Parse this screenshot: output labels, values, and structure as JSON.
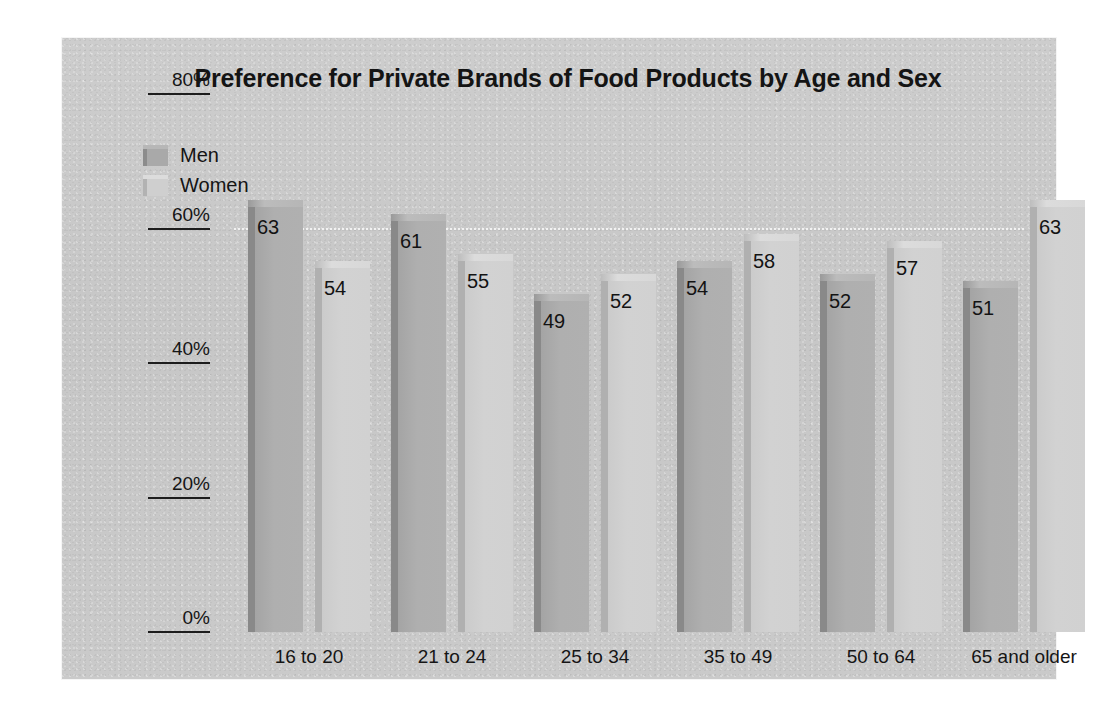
{
  "chart_data": {
    "type": "bar",
    "title": "Preference for Private Brands of Food Products by Age and Sex",
    "xlabel": "",
    "ylabel": "",
    "ylim": [
      0,
      80
    ],
    "ytick_labels": [
      "0%",
      "20%",
      "40%",
      "60%",
      "80%"
    ],
    "ytick_values": [
      0,
      20,
      40,
      60,
      80
    ],
    "grid": "dotted gridline at 60%",
    "legend_position": "top-left inside plot",
    "categories": [
      "16 to 20",
      "21 to 24",
      "25 to 34",
      "35 to 49",
      "50 to 64",
      "65 and older"
    ],
    "series": [
      {
        "name": "Men",
        "color": "#aeaeae",
        "values": [
          63,
          61,
          49,
          54,
          52,
          51
        ]
      },
      {
        "name": "Women",
        "color": "#d1d1d1",
        "values": [
          54,
          55,
          52,
          58,
          57,
          63
        ]
      }
    ],
    "value_labels_shown": true
  },
  "panel": {
    "background_color": "#c9c9c9"
  },
  "axis": {
    "tick_color": "#1d1d1d",
    "gridline_color": "#f2f2f2"
  }
}
